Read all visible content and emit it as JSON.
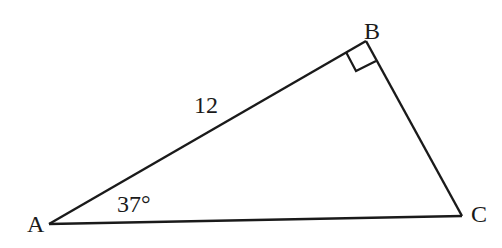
{
  "diagram": {
    "type": "right-triangle",
    "vertices": {
      "A": {
        "label": "A",
        "x": 49,
        "y": 224
      },
      "B": {
        "label": "B",
        "x": 366,
        "y": 41
      },
      "C": {
        "label": "C",
        "x": 462,
        "y": 216
      }
    },
    "right_angle_at": "B",
    "side_labels": [
      {
        "side": "AB",
        "text": "12"
      }
    ],
    "angle_labels": [
      {
        "vertex": "A",
        "text": "37°"
      }
    ],
    "stroke_color": "#1a1a1a",
    "background": "#ffffff"
  }
}
